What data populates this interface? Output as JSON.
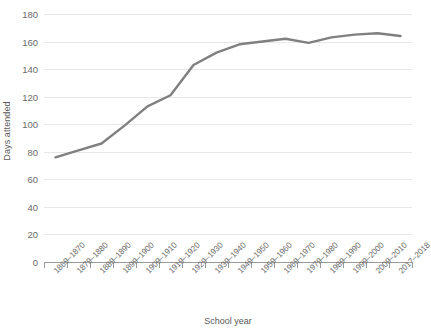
{
  "chart_data": {
    "type": "line",
    "title": "",
    "xlabel": "School year",
    "ylabel": "Days attended",
    "categories": [
      "1869–1870",
      "1879–1880",
      "1889–1890",
      "1899–1900",
      "1909–1910",
      "1919–1920",
      "1929–1930",
      "1939–1940",
      "1949–1950",
      "1959–1960",
      "1969–1970",
      "1979–1980",
      "1989–1990",
      "1999–2000",
      "2009–2010",
      "2017–2018"
    ],
    "values": [
      76,
      81,
      86,
      99,
      113,
      121,
      143,
      152,
      158,
      160,
      162,
      159,
      163,
      165,
      166,
      164
    ],
    "ylim": [
      0,
      180
    ],
    "yticks": [
      0,
      20,
      40,
      60,
      80,
      100,
      120,
      140,
      160,
      180
    ],
    "ytick_labels": [
      "0",
      "20",
      "40",
      "60",
      "80",
      "100",
      "120",
      "140",
      "160",
      "180"
    ],
    "grid": true,
    "legend": "none",
    "series_color": "#808080",
    "gridline_color": "#e8e8e8",
    "axis_color": "#9a9a9a",
    "text_color": "#6b6b6b"
  }
}
